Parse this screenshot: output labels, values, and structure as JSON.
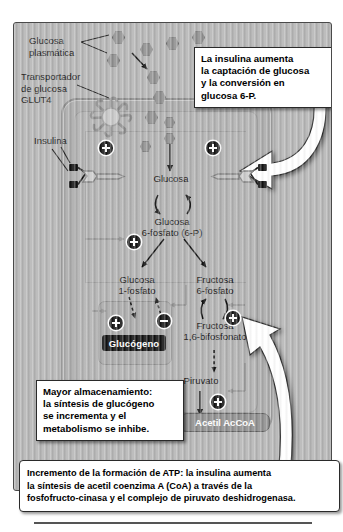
{
  "figure": {
    "labels": {
      "plasma_glucose": "Glucosa\nplasmática",
      "glut4": "Transportador\nde glucosa\nGLUT4",
      "insulin": "Insulina"
    },
    "pathway": {
      "glucose": "Glucosa",
      "glucose_6_phosphate": "Glucosa\n6-fosfato (6-P)",
      "glucose_1_phosphate": "Glucosa\n1-fosfato",
      "fructose_6_phosphate": "Fructosa\n6-fosfato",
      "fructose_1_6_bisphosphate": "Fructosa\n1,6-bifosfonato",
      "pyruvate": "Piruvato",
      "glycogen": "Glucógeno",
      "acetyl_coa": "Acetil AcCoA"
    },
    "callouts": {
      "top": "La insulina aumenta\nla captación de glucosa\ny la conversión en\nglucosa 6-P.",
      "left": "Mayor almacenamiento:\nla síntesis de glucógeno\nse incrementa y el\nmetabolismo se inhibe.",
      "caption": "Incremento de la formación de ATP: la insulina aumenta\nla síntesis de acetil coenzima A (CoA) a través de la\nfosfofructo-cinasa y el complejo de piruvato deshidrogenasa."
    },
    "badges": {
      "stimulate": "+",
      "inhibit": "−"
    },
    "icons": {
      "glucose": "glucose-hexagon-icon",
      "transporter": "glut4-transporter-icon",
      "receptor": "insulin-receptor-icon",
      "pointer": "white-curved-arrow-icon"
    },
    "colors": {
      "background": "#b4b4b4",
      "cell": "#a9a9a9",
      "cytosol": "#b0b0b0",
      "glucose": "#8e8e8e",
      "glycogen_chip": "#111111",
      "accoa_chip": "#8d8d8d",
      "callout": "#ffffff",
      "outline": "#2a2a2a"
    }
  }
}
